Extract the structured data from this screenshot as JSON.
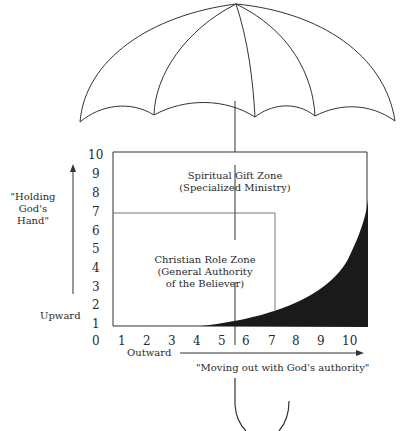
{
  "diagram": {
    "type": "umbrella-authority-diagram",
    "y_axis": {
      "ticks": [
        "10",
        "9",
        "8",
        "7",
        "6",
        "5",
        "4",
        "3",
        "2",
        "1",
        "0"
      ],
      "arrow_label_quote": "\"Holding God's Hand\"",
      "label": "Upward"
    },
    "x_axis": {
      "ticks": [
        "1",
        "2",
        "3",
        "4",
        "5",
        "6",
        "7",
        "8",
        "9",
        "10"
      ],
      "label": "Outward",
      "arrow_label_quote": "\"Moving out with God's authority\""
    },
    "zones": {
      "spiritual_gift": {
        "title": "Spiritual Gift Zone",
        "subtitle": "(Specialized Ministry)"
      },
      "christian_role": {
        "title": "Christian Role Zone",
        "subtitle1": "(General Authority",
        "subtitle2": "of the Believer)"
      }
    },
    "colors": {
      "line": "#333333",
      "fill": "#1a1a1a",
      "background": "#ffffff"
    }
  }
}
